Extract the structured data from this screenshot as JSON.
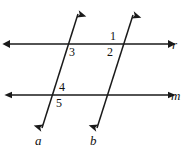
{
  "figure": {
    "background_color": "#ffffff",
    "stroke_color": "#1a1a1a",
    "label_color": "#111111",
    "width": 192,
    "height": 151,
    "lines": [
      {
        "name": "r",
        "label": "r",
        "orientation": "horizontal",
        "from": [
          10,
          44
        ],
        "to": [
          168,
          44
        ],
        "arrows": "both",
        "label_pos": [
          172,
          38
        ]
      },
      {
        "name": "m",
        "label": "m",
        "orientation": "horizontal",
        "from": [
          12,
          95
        ],
        "to": [
          168,
          95
        ],
        "arrows": "both",
        "label_pos": [
          171,
          89
        ]
      },
      {
        "name": "a",
        "label": "a",
        "orientation": "transversal",
        "from": [
          78,
          14
        ],
        "to": [
          42,
          128
        ],
        "arrows": "both",
        "label_pos": [
          35,
          134
        ]
      },
      {
        "name": "b",
        "label": "b",
        "orientation": "transversal",
        "from": [
          133,
          15
        ],
        "to": [
          97,
          128
        ],
        "arrows": "both",
        "label_pos": [
          90,
          134
        ]
      }
    ],
    "angle_labels": [
      {
        "id": "1",
        "text": "1",
        "x": 110,
        "y": 30,
        "at": "line-b-above-r-left"
      },
      {
        "id": "2",
        "text": "2",
        "x": 107,
        "y": 46,
        "at": "line-b-below-r-left"
      },
      {
        "id": "3",
        "text": "3",
        "x": 69,
        "y": 46,
        "at": "line-a-below-r-right"
      },
      {
        "id": "4",
        "text": "4",
        "x": 59,
        "y": 81,
        "at": "line-a-above-m-right"
      },
      {
        "id": "5",
        "text": "5",
        "x": 56,
        "y": 97,
        "at": "line-a-below-m-right"
      }
    ]
  }
}
